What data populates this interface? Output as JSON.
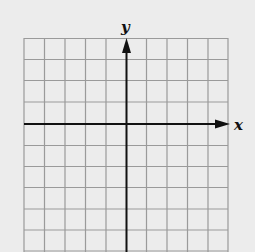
{
  "diagram": {
    "type": "coordinate-grid",
    "x_axis_label": "x",
    "y_axis_label": "y",
    "grid_columns": 10,
    "grid_rows": 10,
    "colors": {
      "background": "#ececec",
      "grid": "#9a9a9a",
      "axis": "#111111"
    }
  }
}
